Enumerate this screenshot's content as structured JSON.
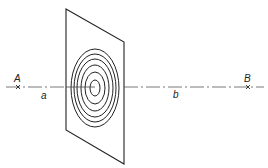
{
  "diagram": {
    "type": "zone plate / concentric rings on plane with optical axis",
    "labels": {
      "point_a": "A",
      "point_b": "B",
      "distance_a": "a",
      "distance_b": "b"
    },
    "rings": {
      "count": 6
    },
    "colors": {
      "stroke": "#222222",
      "background": "#ffffff"
    }
  }
}
